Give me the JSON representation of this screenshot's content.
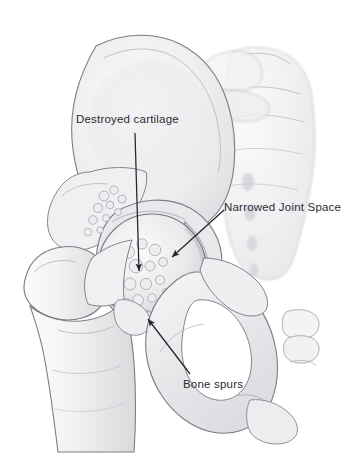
{
  "figure": {
    "background_color": "#ffffff",
    "line_color": "#6f7078",
    "bone_fill": "#f2f2f3",
    "bone_shade": "#d9d9dd",
    "label_color": "#2b2b33"
  },
  "labels": [
    {
      "id": "destroyed-cartilage",
      "text": "Destroyed cartilage",
      "x": 76,
      "y": 114,
      "arrow": {
        "from_x": 135,
        "from_y": 133,
        "to_x": 139,
        "to_y": 273
      }
    },
    {
      "id": "narrowed-joint-space",
      "text": "Narrowed Joint Space",
      "x": 224,
      "y": 202,
      "arrow": {
        "from_x": 224,
        "from_y": 210,
        "to_x": 171,
        "to_y": 258
      }
    },
    {
      "id": "bone-spurs",
      "text": "Bone spurs",
      "x": 183,
      "y": 379,
      "arrow": {
        "from_x": 190,
        "from_y": 374,
        "to_x": 147,
        "to_y": 317
      }
    }
  ],
  "anatomy_parts": [
    {
      "name": "ilium",
      "label": "Ilium (iliac wing)"
    },
    {
      "name": "acetabulum",
      "label": "Acetabulum"
    },
    {
      "name": "femoral-head",
      "label": "Femoral head"
    },
    {
      "name": "femoral-neck",
      "label": "Femoral neck"
    },
    {
      "name": "greater-trochanter",
      "label": "Greater trochanter"
    },
    {
      "name": "lesser-trochanter",
      "label": "Lesser trochanter"
    },
    {
      "name": "femur-shaft",
      "label": "Femur shaft"
    },
    {
      "name": "obturator-foramen",
      "label": "Obturator foramen"
    },
    {
      "name": "pubis",
      "label": "Pubis"
    },
    {
      "name": "ischium",
      "label": "Ischium"
    },
    {
      "name": "sacrum",
      "label": "Sacrum"
    },
    {
      "name": "coccyx",
      "label": "Coccyx"
    },
    {
      "name": "bone-spur-nodules",
      "label": "Osteophyte nodules"
    }
  ]
}
